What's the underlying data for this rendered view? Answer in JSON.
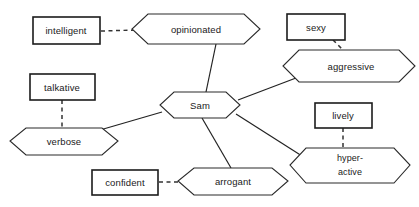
{
  "diagram": {
    "type": "semantic-network",
    "center": {
      "id": "sam",
      "label": "Sam",
      "shape": "hexagon",
      "x": 200,
      "y": 105,
      "w": 80,
      "h": 27
    },
    "trait_nodes": [
      {
        "id": "opinionated",
        "label": "opinionated",
        "shape": "hexagon",
        "x": 196,
        "y": 29,
        "w": 128,
        "h": 30
      },
      {
        "id": "aggressive",
        "label": "aggressive",
        "shape": "hexagon",
        "x": 349,
        "y": 66,
        "w": 132,
        "h": 32
      },
      {
        "id": "hyperactive",
        "label": "hyper-",
        "label2": "active",
        "shape": "hexagon",
        "x": 350,
        "y": 165,
        "w": 120,
        "h": 35
      },
      {
        "id": "arrogant",
        "label": "arrogant",
        "shape": "hexagon",
        "x": 233,
        "y": 181,
        "w": 110,
        "h": 28
      },
      {
        "id": "verbose",
        "label": "verbose",
        "shape": "hexagon",
        "x": 64,
        "y": 141,
        "w": 108,
        "h": 28
      }
    ],
    "attribute_nodes": [
      {
        "id": "intelligent",
        "label": "intelligent",
        "shape": "rect",
        "x": 66,
        "y": 30,
        "w": 67,
        "h": 27
      },
      {
        "id": "sexy",
        "label": "sexy",
        "shape": "rect",
        "x": 316,
        "y": 27,
        "w": 58,
        "h": 26
      },
      {
        "id": "lively",
        "label": "lively",
        "shape": "rect",
        "x": 343,
        "y": 115,
        "w": 57,
        "h": 25
      },
      {
        "id": "talkative",
        "label": "talkative",
        "shape": "rect",
        "x": 62,
        "y": 87,
        "w": 65,
        "h": 26
      },
      {
        "id": "confident",
        "label": "confident",
        "shape": "rect",
        "x": 125,
        "y": 182,
        "w": 66,
        "h": 25
      }
    ],
    "solid_edges": [
      {
        "from": "sam",
        "to": "opinionated",
        "x1": 206,
        "y1": 92,
        "x2": 216,
        "y2": 44
      },
      {
        "from": "sam",
        "to": "aggressive",
        "x1": 238,
        "y1": 100,
        "x2": 296,
        "y2": 78
      },
      {
        "from": "sam",
        "to": "hyperactive",
        "x1": 236,
        "y1": 114,
        "x2": 302,
        "y2": 156
      },
      {
        "from": "sam",
        "to": "arrogant",
        "x1": 202,
        "y1": 118,
        "x2": 231,
        "y2": 168
      },
      {
        "from": "sam",
        "to": "verbose",
        "x1": 162,
        "y1": 112,
        "x2": 100,
        "y2": 130
      }
    ],
    "dashed_edges": [
      {
        "from": "intelligent",
        "to": "opinionated",
        "x1": 100,
        "y1": 31,
        "x2": 136,
        "y2": 30
      },
      {
        "from": "sexy",
        "to": "aggressive",
        "x1": 334,
        "y1": 40,
        "x2": 345,
        "y2": 52
      },
      {
        "from": "lively",
        "to": "hyperactive",
        "x1": 343,
        "y1": 128,
        "x2": 343,
        "y2": 150
      },
      {
        "from": "talkative",
        "to": "verbose",
        "x1": 62,
        "y1": 100,
        "x2": 62,
        "y2": 128
      },
      {
        "from": "confident",
        "to": "arrogant",
        "x1": 158,
        "y1": 182,
        "x2": 182,
        "y2": 182
      }
    ]
  }
}
